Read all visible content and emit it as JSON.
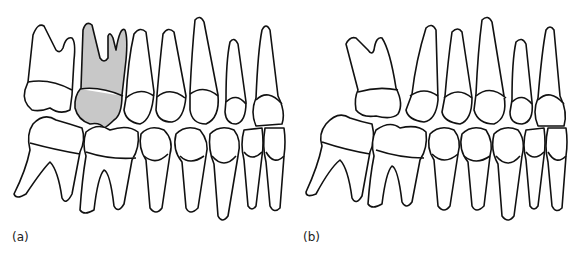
{
  "figure": {
    "panels": [
      {
        "label": "(a)",
        "description": "Lateral view of dentition with highlighted upper first molar",
        "highlight_color": "#c8c8c8"
      },
      {
        "label": "(b)",
        "description": "Lateral view of dentition with upper molar tipped/missing adjacent tooth"
      }
    ]
  }
}
